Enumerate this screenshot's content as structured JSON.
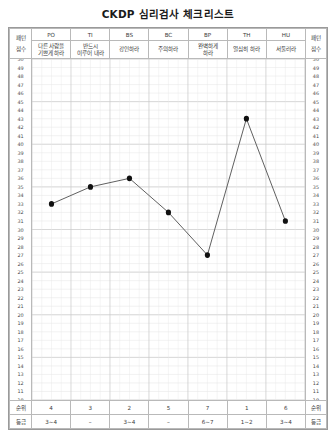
{
  "title": "CKDP 심리검사 체크리스트",
  "header": {
    "corner_left_top": "패턴",
    "corner_left_bottom": "점수",
    "corner_right_top": "패턴",
    "corner_right_bottom": "점수",
    "codes": [
      "PO",
      "TI",
      "BS",
      "BC",
      "BP",
      "TH",
      "HU"
    ],
    "names": [
      "다른 사람을\n기쁘게 하라",
      "반드시\n이루어 내라",
      "강인하라",
      "주의하라",
      "완벽하게\n하라",
      "열심히 하라",
      "서둘러라"
    ]
  },
  "footer": {
    "rank_label_left": "순위",
    "rank_label_right": "순위",
    "grade_label_left": "등급",
    "grade_label_right": "등급",
    "ranks": [
      "4",
      "3",
      "2",
      "5",
      "7",
      "1",
      "6"
    ],
    "grades": [
      "3~4",
      "–",
      "3~4",
      "–",
      "6~7",
      "1~2",
      "3~4"
    ]
  },
  "chart_data": {
    "type": "line",
    "title": "CKDP 심리검사 체크리스트",
    "xlabel": "",
    "ylabel": "점수",
    "categories": [
      "PO",
      "TI",
      "BS",
      "BC",
      "BP",
      "TH",
      "HU"
    ],
    "category_names": [
      "다른 사람을 기쁘게 하라",
      "반드시 이루어 내라",
      "강인하라",
      "주의하라",
      "완벽하게 하라",
      "열심히 하라",
      "서둘러라"
    ],
    "values": [
      33,
      35,
      36,
      32,
      27,
      43,
      31
    ],
    "ylim": [
      10,
      50
    ],
    "ytick_step": 1,
    "yticks": [
      50,
      49,
      48,
      47,
      46,
      45,
      44,
      43,
      42,
      41,
      40,
      39,
      38,
      37,
      36,
      35,
      34,
      33,
      32,
      31,
      30,
      29,
      28,
      27,
      26,
      25,
      24,
      23,
      22,
      21,
      20,
      19,
      18,
      17,
      16,
      15,
      14,
      13,
      12,
      11,
      10
    ],
    "grid": true,
    "legend": "none",
    "marker": "circle",
    "line_color": "#555555",
    "marker_color": "#111111"
  },
  "colors": {
    "line": "#555555",
    "marker": "#111111",
    "grid_major": "#c9c9c9",
    "grid_minor": "#e6e6e6",
    "border": "#9a9a9a"
  }
}
